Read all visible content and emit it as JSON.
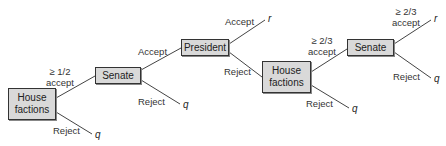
{
  "diagram": {
    "type": "game-tree",
    "nodes": [
      {
        "id": "house1",
        "label_line1": "House",
        "label_line2": "factions"
      },
      {
        "id": "senate1",
        "label": "Senate"
      },
      {
        "id": "president",
        "label": "President"
      },
      {
        "id": "house2",
        "label_line1": "House",
        "label_line2": "factions"
      },
      {
        "id": "senate2",
        "label": "Senate"
      }
    ],
    "edges": [
      {
        "from": "house1",
        "to": "senate1",
        "label_line1": "≥  1/2",
        "label_line2": "accept"
      },
      {
        "from": "house1",
        "to": "q",
        "label": "Reject"
      },
      {
        "from": "senate1",
        "to": "president",
        "label": "Accept"
      },
      {
        "from": "senate1",
        "to": "q",
        "label": "Reject"
      },
      {
        "from": "president",
        "to": "r",
        "label": "Accept"
      },
      {
        "from": "president",
        "to": "house2",
        "label": "Reject"
      },
      {
        "from": "house2",
        "to": "senate2",
        "label_line1": "≥  2/3",
        "label_line2": "accept"
      },
      {
        "from": "house2",
        "to": "q",
        "label": "Reject"
      },
      {
        "from": "senate2",
        "to": "r",
        "label_line1": "≥  2/3",
        "label_line2": "accept"
      },
      {
        "from": "senate2",
        "to": "q",
        "label": "Reject"
      }
    ],
    "outcomes": {
      "status_quo": "q",
      "reform": "r"
    }
  }
}
